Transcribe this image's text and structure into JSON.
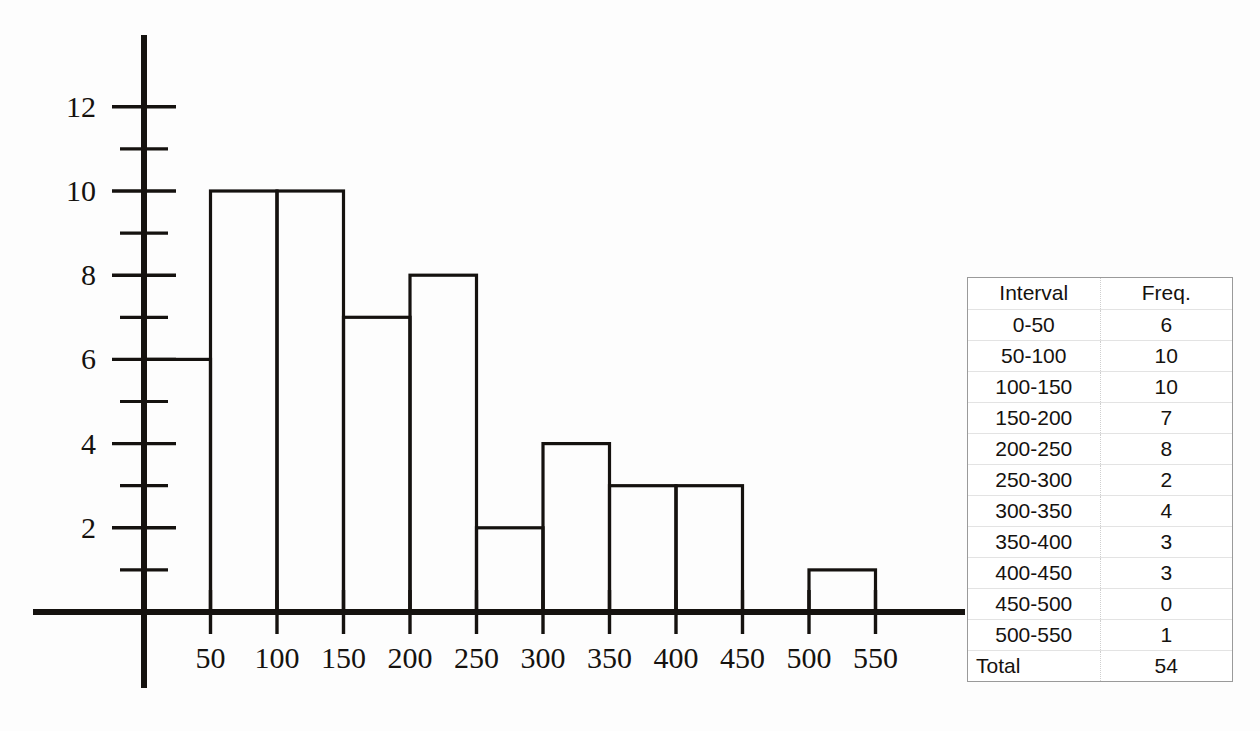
{
  "chart_data": {
    "type": "bar",
    "title": "",
    "xlabel": "",
    "ylabel": "",
    "categories": [
      "0-50",
      "50-100",
      "100-150",
      "150-200",
      "200-250",
      "250-300",
      "300-350",
      "350-400",
      "400-450",
      "450-500",
      "500-550"
    ],
    "bin_edges": [
      0,
      50,
      100,
      150,
      200,
      250,
      300,
      350,
      400,
      450,
      500,
      550
    ],
    "values": [
      6,
      10,
      10,
      7,
      8,
      2,
      4,
      3,
      3,
      0,
      1
    ],
    "xlim": [
      0,
      600
    ],
    "ylim": [
      0,
      13
    ],
    "x_tick_labels": [
      "50",
      "100",
      "150",
      "200",
      "250",
      "300",
      "350",
      "400",
      "450",
      "500",
      "550"
    ],
    "x_tick_values": [
      50,
      100,
      150,
      200,
      250,
      300,
      350,
      400,
      450,
      500,
      550
    ],
    "y_tick_labels": [
      "2",
      "4",
      "6",
      "8",
      "10",
      "12"
    ],
    "y_tick_values": [
      2,
      4,
      6,
      8,
      10,
      12
    ],
    "y_minor_tick_values": [
      1,
      3,
      5,
      7,
      9,
      11
    ],
    "grid": false,
    "legend": null,
    "bar_style": "outlined",
    "bar_fill": "#ffffff",
    "bar_stroke": "#15120f",
    "axis_color": "#15120f"
  },
  "table": {
    "header": {
      "interval": "Interval",
      "freq": "Freq."
    },
    "rows": [
      {
        "interval": "0-50",
        "freq": "6"
      },
      {
        "interval": "50-100",
        "freq": "10"
      },
      {
        "interval": "100-150",
        "freq": "10"
      },
      {
        "interval": "150-200",
        "freq": "7"
      },
      {
        "interval": "200-250",
        "freq": "8"
      },
      {
        "interval": "250-300",
        "freq": "2"
      },
      {
        "interval": "300-350",
        "freq": "4"
      },
      {
        "interval": "350-400",
        "freq": "3"
      },
      {
        "interval": "400-450",
        "freq": "3"
      },
      {
        "interval": "450-500",
        "freq": "0"
      },
      {
        "interval": "500-550",
        "freq": "1"
      }
    ],
    "total": {
      "label": "Total",
      "value": "54"
    }
  },
  "colors": {
    "ink": "#15120f",
    "background": "#fdfdfd",
    "table_border": "#9a9a9a",
    "table_rule": "#e3e3e3",
    "table_divider": "#cfcfcf"
  }
}
